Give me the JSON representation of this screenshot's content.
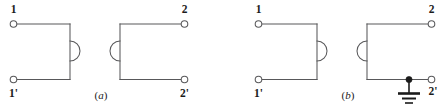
{
  "figure": {
    "type": "circuit-diagram",
    "stroke_color": "#58585a",
    "label_color": "#1b1b1b",
    "background_color": "#ffffff",
    "ground_color": "#1b1b1b",
    "subfigures": [
      {
        "id": "a",
        "caption": "(a)",
        "caption_open_paren": "(",
        "caption_letter": "a",
        "caption_close_paren": ")",
        "has_ground": false,
        "terminals": [
          {
            "id": "t1",
            "label": "1",
            "shape": "open-circle",
            "position": "top-left"
          },
          {
            "id": "t1p",
            "label": "1'",
            "shape": "open-circle",
            "position": "bottom-left"
          },
          {
            "id": "t2",
            "label": "2",
            "shape": "open-circle",
            "position": "top-right"
          },
          {
            "id": "t2p",
            "label": "2'",
            "shape": "open-circle",
            "position": "bottom-right"
          }
        ],
        "boxes": [
          {
            "id": "left-network",
            "bump_side": "right"
          },
          {
            "id": "right-network",
            "bump_side": "left"
          }
        ]
      },
      {
        "id": "b",
        "caption": "(b)",
        "caption_open_paren": "(",
        "caption_letter": "b",
        "caption_close_paren": ")",
        "has_ground": true,
        "ground_symbol": "earth-ground",
        "junction_dot": true,
        "terminals": [
          {
            "id": "t1",
            "label": "1",
            "shape": "open-circle",
            "position": "top-left"
          },
          {
            "id": "t1p",
            "label": "1'",
            "shape": "open-circle",
            "position": "bottom-left"
          },
          {
            "id": "t2",
            "label": "2",
            "shape": "open-circle",
            "position": "top-right"
          },
          {
            "id": "t2p",
            "label": "2'",
            "shape": "open-circle",
            "position": "bottom-right"
          }
        ],
        "boxes": [
          {
            "id": "left-network",
            "bump_side": "right"
          },
          {
            "id": "right-network",
            "bump_side": "left"
          }
        ]
      }
    ]
  }
}
